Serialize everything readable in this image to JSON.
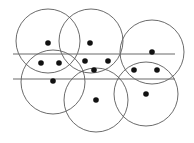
{
  "diagram": {
    "colors": {
      "circle_stroke": "#5a5a5a",
      "line_stroke": "#6a6a6a",
      "dot_fill": "#111111",
      "background": "#ffffff"
    },
    "circles": [
      {
        "cx": 48,
        "cy": 41,
        "r": 32
      },
      {
        "cx": 91,
        "cy": 41,
        "r": 32
      },
      {
        "cx": 152,
        "cy": 52,
        "r": 32
      },
      {
        "cx": 53,
        "cy": 82,
        "r": 32
      },
      {
        "cx": 96,
        "cy": 100,
        "r": 32
      },
      {
        "cx": 146,
        "cy": 94,
        "r": 32
      }
    ],
    "lines": [
      {
        "x1": 13,
        "y1": 54,
        "x2": 175,
        "y2": 54
      },
      {
        "x1": 13,
        "y1": 79,
        "x2": 175,
        "y2": 79
      }
    ],
    "points": [
      {
        "x": 48,
        "y": 43
      },
      {
        "x": 90,
        "y": 43
      },
      {
        "x": 152,
        "y": 52
      },
      {
        "x": 41,
        "y": 63
      },
      {
        "x": 59,
        "y": 63
      },
      {
        "x": 85,
        "y": 61
      },
      {
        "x": 108,
        "y": 61
      },
      {
        "x": 94,
        "y": 70
      },
      {
        "x": 134,
        "y": 70
      },
      {
        "x": 157,
        "y": 70
      },
      {
        "x": 53,
        "y": 81
      },
      {
        "x": 96,
        "y": 100
      },
      {
        "x": 146,
        "y": 94
      }
    ],
    "point_radius": 2.8
  }
}
